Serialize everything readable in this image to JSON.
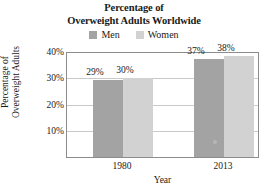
{
  "chart_data": {
    "type": "bar",
    "title": "Percentage of Overweight Adults Worldwide",
    "title_lines": [
      "Percentage of",
      "Overweight Adults Worldwide"
    ],
    "xlabel": "Year",
    "ylabel": "Percentage of Overweight Adults",
    "ylabel_lines": [
      "Percentage of",
      "Overweight Adults"
    ],
    "categories": [
      "1980",
      "2013"
    ],
    "series": [
      {
        "name": "Men",
        "values": [
          29,
          30
        ],
        "color": "#a3a3a3"
      },
      {
        "name": "Women",
        "values": [
          30,
          38
        ],
        "color": "#d2d2d2"
      }
    ],
    "ylim": [
      0,
      40
    ],
    "yticks": [
      40,
      30,
      20,
      10
    ],
    "ytick_labels": [
      "40%",
      "30%",
      "20%",
      "10%"
    ],
    "grid": true,
    "legend_position": "top",
    "data_labels": [
      {
        "category": "1980",
        "series": "Men",
        "text": "29%"
      },
      {
        "category": "1980",
        "series": "Women",
        "text": "30%"
      },
      {
        "category": "2013",
        "series": "Men",
        "text": "37%"
      },
      {
        "category": "2013",
        "series": "Women",
        "text": "38%"
      }
    ]
  },
  "title": {
    "line1": "Percentage of",
    "line2": "Overweight Adults Worldwide"
  },
  "legend": {
    "items": [
      {
        "label": "Men",
        "color": "#a3a3a3"
      },
      {
        "label": "Women",
        "color": "#d2d2d2"
      }
    ]
  },
  "axes": {
    "y": {
      "title_line1": "Percentage of",
      "title_line2": "Overweight Adults",
      "ticks": [
        {
          "label": "40%"
        },
        {
          "label": "30%"
        },
        {
          "label": "20%"
        },
        {
          "label": "10%"
        }
      ]
    },
    "x": {
      "title": "Year",
      "ticks": [
        {
          "label": "1980"
        },
        {
          "label": "2013"
        }
      ]
    }
  },
  "bars": [
    {
      "group": "1980",
      "series": "Men",
      "value": "29%"
    },
    {
      "group": "1980",
      "series": "Women",
      "value": "30%"
    },
    {
      "group": "2013",
      "series": "Men",
      "value": "37%"
    },
    {
      "group": "2013",
      "series": "Women",
      "value": "38%"
    }
  ]
}
